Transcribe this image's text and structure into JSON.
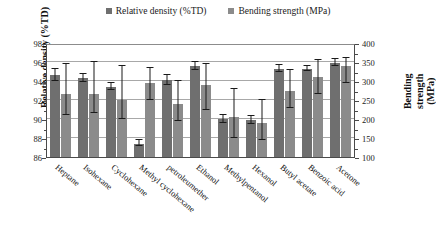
{
  "chart_data": {
    "type": "bar",
    "title": "",
    "xlabel": "",
    "ylabel": "Relative density (%TD)",
    "y2label": "Bending strength (MPa)",
    "y2label_lines": [
      "Bending",
      "strength",
      "(MPa)"
    ],
    "ylim": [
      86,
      98
    ],
    "y2lim": [
      100,
      400
    ],
    "yticks": [
      86,
      88,
      90,
      92,
      94,
      96,
      98
    ],
    "y2ticks": [
      100,
      150,
      200,
      250,
      300,
      350,
      400
    ],
    "grid": true,
    "legend_position": "top-center",
    "categories": [
      "Heptane",
      "Isohexane",
      "Cyclohexane",
      "Methyl cyclohexane",
      "petroleumether",
      "Ethanol",
      "Methylpentanol",
      "Hexanol",
      "Butyl acetate",
      "Benzoic acid",
      "Acetone"
    ],
    "series": [
      {
        "name": "Relative density (%TD)",
        "axis": "left",
        "unit": "%TD",
        "color": "#6f6f6f",
        "values": [
          94.6,
          94.3,
          93.4,
          87.4,
          94.1,
          95.6,
          90.0,
          89.9,
          95.3,
          95.3,
          95.9
        ],
        "err_low": [
          94.0,
          93.9,
          93.1,
          87.2,
          93.6,
          95.2,
          89.6,
          89.5,
          94.9,
          95.1,
          95.6
        ],
        "err_high": [
          95.3,
          94.7,
          93.8,
          87.8,
          94.6,
          96.0,
          90.4,
          90.3,
          95.7,
          95.6,
          96.3
        ]
      },
      {
        "name": "Bending strength (MPa)",
        "axis": "right",
        "unit": "MPa",
        "color": "#8b8b8b",
        "values": [
          265,
          265,
          250,
          295,
          240,
          290,
          205,
          190,
          275,
          310,
          340
        ],
        "err_low": [
          210,
          215,
          200,
          250,
          195,
          225,
          150,
          145,
          230,
          265,
          295
        ],
        "err_high": [
          345,
          350,
          340,
          335,
          300,
          345,
          280,
          250,
          330,
          355,
          360
        ]
      }
    ]
  },
  "legend": {
    "items": [
      {
        "label": "Relative density (%TD)",
        "color": "#6f6f6f"
      },
      {
        "label": "Bending strength (MPa)",
        "color": "#8b8b8b"
      }
    ]
  }
}
